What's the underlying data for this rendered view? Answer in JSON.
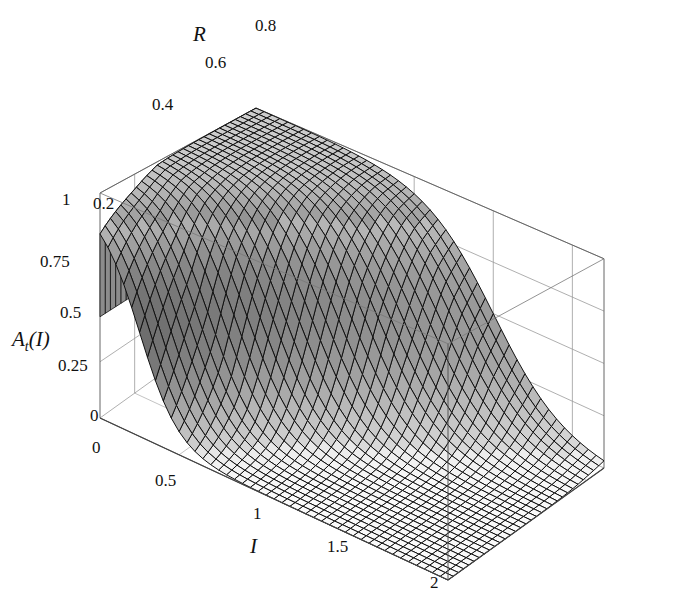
{
  "chart_data": {
    "type": "surface3d",
    "title": "",
    "xlabel": "I",
    "ylabel": "R",
    "zlabel": "A_t(I)",
    "xlim": [
      0,
      2.2
    ],
    "ylim": [
      0,
      0.9
    ],
    "zlim": [
      0,
      1
    ],
    "x_ticks": [
      "0",
      "0.5",
      "1",
      "1.5",
      "2"
    ],
    "y_ticks": [
      "0.2",
      "0.4",
      "0.6",
      "0.8"
    ],
    "z_ticks": [
      "0",
      "0.25",
      "0.5",
      "0.75",
      "1"
    ],
    "grid": true,
    "box": true,
    "sample_points": [
      {
        "R": 0.0,
        "I_half": 0.25
      },
      {
        "R": 0.2,
        "I_half": 0.45
      },
      {
        "R": 0.4,
        "I_half": 0.75
      },
      {
        "R": 0.6,
        "I_half": 1.1
      },
      {
        "R": 0.8,
        "I_half": 1.4
      },
      {
        "R": 0.9,
        "I_half": 1.5
      }
    ]
  },
  "labels": {
    "z_axis": "A",
    "z_axis_sub": "t",
    "z_axis_arg": "(I)",
    "x_axis": "I",
    "y_axis": "R",
    "origin_zero": "0"
  }
}
